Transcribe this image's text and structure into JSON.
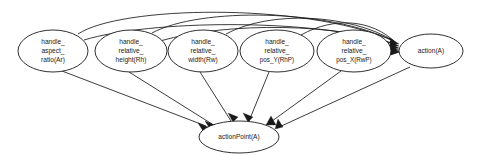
{
  "diagram": {
    "type": "directed-acyclic-graph",
    "title": "",
    "background_color": "#ffffff",
    "line_color": "#1a1a1a",
    "node_fill": "#ffffff",
    "nodes": [
      {
        "id": "handle_aspect_ratio",
        "lines": [
          "handle_",
          "aspect_",
          "ratio(Ar)"
        ],
        "cx": 53,
        "cy": 51,
        "rx": 35,
        "ry": 21
      },
      {
        "id": "handle_relative_height",
        "lines": [
          "handle_",
          "relative_",
          "height(Rh)"
        ],
        "cx": 131,
        "cy": 51,
        "rx": 36,
        "ry": 21
      },
      {
        "id": "handle_relative_width",
        "lines": [
          "handle_",
          "relative_",
          "width(Rw)"
        ],
        "cx": 203,
        "cy": 51,
        "rx": 35,
        "ry": 21
      },
      {
        "id": "handle_relative_pos_Y",
        "lines": [
          "handle_",
          "relative_",
          "pos_Y(RhP)"
        ],
        "cx": 277,
        "cy": 51,
        "rx": 37,
        "ry": 21
      },
      {
        "id": "handle_relative_pos_X",
        "lines": [
          "handle_",
          "relative_",
          "pos_X(RwP)"
        ],
        "cx": 354,
        "cy": 51,
        "rx": 37,
        "ry": 21
      },
      {
        "id": "action",
        "lines": [
          "action(A)"
        ],
        "cx": 431,
        "cy": 51,
        "rx": 32,
        "ry": 17
      },
      {
        "id": "actionPoint",
        "lines": [
          "actionPoint(A)"
        ],
        "cx": 239,
        "cy": 137,
        "rx": 40,
        "ry": 16
      }
    ],
    "edges": [
      {
        "from": "handle_aspect_ratio",
        "to": "action",
        "style": "arc-over-top"
      },
      {
        "from": "handle_relative_height",
        "to": "action",
        "style": "arc-over-top"
      },
      {
        "from": "handle_relative_width",
        "to": "action",
        "style": "arc-over-top"
      },
      {
        "from": "handle_relative_pos_Y",
        "to": "action",
        "style": "arc-over-top"
      },
      {
        "from": "handle_relative_pos_X",
        "to": "action",
        "style": "straight"
      },
      {
        "from": "handle_aspect_ratio",
        "to": "actionPoint",
        "style": "straight"
      },
      {
        "from": "handle_relative_height",
        "to": "actionPoint",
        "style": "straight"
      },
      {
        "from": "handle_relative_width",
        "to": "actionPoint",
        "style": "straight"
      },
      {
        "from": "handle_relative_pos_Y",
        "to": "actionPoint",
        "style": "straight"
      },
      {
        "from": "handle_relative_pos_X",
        "to": "actionPoint",
        "style": "straight"
      },
      {
        "from": "action",
        "to": "actionPoint",
        "style": "straight"
      }
    ]
  }
}
